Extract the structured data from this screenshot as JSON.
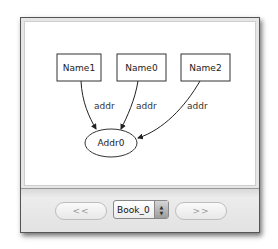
{
  "graph": {
    "nodes": [
      {
        "id": "Name1",
        "label": "Name1",
        "shape": "box"
      },
      {
        "id": "Name0",
        "label": "Name0",
        "shape": "box"
      },
      {
        "id": "Name2",
        "label": "Name2",
        "shape": "box"
      },
      {
        "id": "Addr0",
        "label": "Addr0",
        "shape": "ellipse"
      }
    ],
    "edges": [
      {
        "from": "Name1",
        "to": "Addr0",
        "label": "addr"
      },
      {
        "from": "Name0",
        "to": "Addr0",
        "label": "addr"
      },
      {
        "from": "Name2",
        "to": "Addr0",
        "label": "addr"
      }
    ]
  },
  "footer": {
    "prev_label": "<<",
    "next_label": ">>",
    "selected_instance": "Book_0"
  }
}
